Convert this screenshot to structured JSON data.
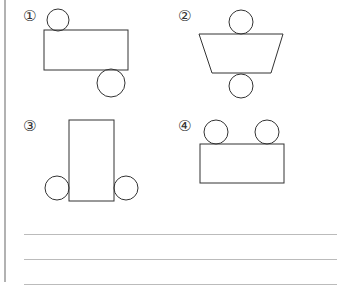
{
  "figures": [
    {
      "label": "①",
      "description": "rectangle with circle on top-left and circle on bottom-right"
    },
    {
      "label": "②",
      "description": "trapezoid with circle on top and circle on bottom"
    },
    {
      "label": "③",
      "description": "tall rectangle with circles on left and right at bottom"
    },
    {
      "label": "④",
      "description": "rectangle with two circles on top"
    }
  ],
  "answer_lines": 3,
  "colors": {
    "stroke": "#333333",
    "rule": "#bbbbbb",
    "border": "#999999"
  }
}
